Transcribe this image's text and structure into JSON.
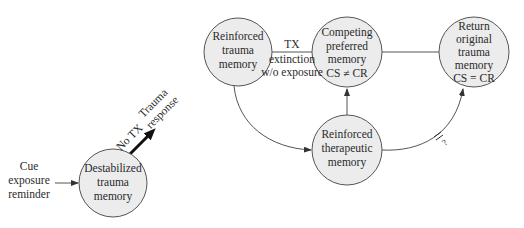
{
  "diagram": {
    "nodes": {
      "destabilized": {
        "lines": [
          "Destabilized",
          "trauma",
          "memory"
        ]
      },
      "reinforced_trauma": {
        "lines": [
          "Reinforced",
          "trauma",
          "memory"
        ]
      },
      "competing": {
        "lines": [
          "Competing",
          "preferred",
          "memory",
          "CS ≠ CR"
        ]
      },
      "therapeutic": {
        "lines": [
          "Reinforced",
          "therapeutic",
          "memory"
        ]
      },
      "return_original": {
        "lines": [
          "Return",
          "original",
          "trauma",
          "memory",
          "CS = CR"
        ]
      }
    },
    "labels": {
      "cue": [
        "Cue",
        "exposure",
        "reminder"
      ],
      "no_tx": "No TX",
      "trauma_response": [
        "Trauma",
        "response"
      ],
      "tx_extinction": [
        "TX",
        "extinction",
        "w/o exposure"
      ],
      "blocked_mark": "?"
    },
    "colors": {
      "node_fill": "#ececec",
      "node_stroke": "#555555",
      "edge": "#555555",
      "bold_arrow": "#111111"
    }
  }
}
